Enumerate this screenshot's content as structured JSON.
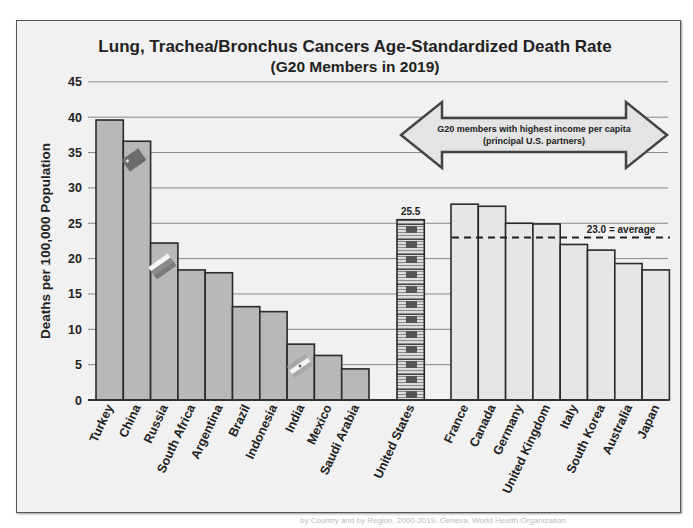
{
  "chart_data": {
    "type": "bar",
    "title": "Lung, Trachea/Bronchus Cancers Age-Standardized Death Rate",
    "subtitle": "(G20 Members in 2019)",
    "xlabel": "",
    "ylabel": "Deaths per 100,000 Population",
    "ylim": [
      0,
      45
    ],
    "yticks": [
      0,
      5,
      10,
      15,
      20,
      25,
      30,
      35,
      40,
      45
    ],
    "grid": true,
    "groups": [
      {
        "name": "other-g20",
        "color": "#b8b8b8",
        "categories": [
          "Turkey",
          "China",
          "Russia",
          "South Africa",
          "Argentina",
          "Brazil",
          "Indonesia",
          "India",
          "Mexico",
          "Saudi Arabia"
        ],
        "values": [
          39.6,
          36.6,
          22.2,
          18.4,
          18.0,
          13.2,
          12.5,
          7.9,
          6.3,
          4.4
        ]
      },
      {
        "name": "united-states",
        "color": "#555555",
        "categories": [
          "United States"
        ],
        "values": [
          25.5
        ],
        "data_label": "25.5"
      },
      {
        "name": "high-income-partners",
        "color": "#e6e6e6",
        "categories": [
          "France",
          "Canada",
          "Germany",
          "United Kingdom",
          "Italy",
          "South Korea",
          "Australia",
          "Japan"
        ],
        "values": [
          27.7,
          27.4,
          25.0,
          24.9,
          22.0,
          21.2,
          19.3,
          18.4
        ]
      }
    ],
    "annotations": {
      "arrow_text_line1": "G20 members with highest income per capita",
      "arrow_text_line2": "(principal U.S. partners)",
      "average_value": 23.0,
      "average_label": "23.0 = average"
    },
    "flag_overlays": [
      "China",
      "Russia",
      "India"
    ]
  },
  "footer": "by Country and by Region, 2000-2019. Geneva, World Health Organization"
}
